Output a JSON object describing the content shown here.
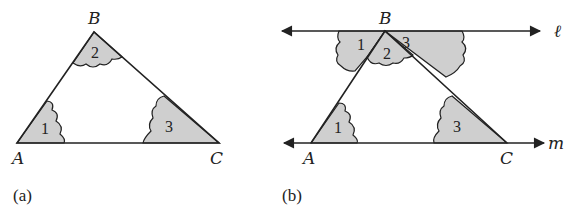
{
  "figure_a": {
    "caption": "(a)",
    "vertices": {
      "A": "A",
      "B": "B",
      "C": "C"
    },
    "angles": [
      "1",
      "2",
      "3"
    ]
  },
  "figure_b": {
    "caption": "(b)",
    "vertices": {
      "A": "A",
      "B": "B",
      "C": "C"
    },
    "angles_top": [
      "1",
      "2",
      "3"
    ],
    "angles_bottom": [
      "1",
      "3"
    ],
    "lines": {
      "top": "ℓ",
      "bottom": "m"
    }
  },
  "colors": {
    "shade": "#cfcfcf",
    "stroke": "#222222"
  }
}
